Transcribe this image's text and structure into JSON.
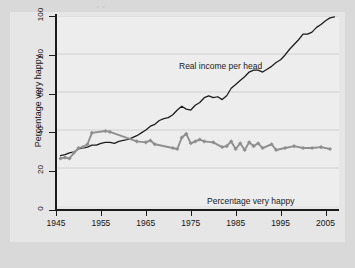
{
  "figure": {
    "background_color": "#d9d9d9",
    "panel_color": "#e6e6e6",
    "plot_color": "#ededed"
  },
  "bleed_text": {
    "top": "..",
    "middle": "Are we richer"
  },
  "chart_data": {
    "type": "line",
    "title": "",
    "subtitle": "",
    "xlabel": "",
    "ylabel": "Percentage very happy",
    "xlim": [
      1945,
      2008
    ],
    "ylim": [
      0,
      100
    ],
    "grid": true,
    "grid_axis": "y",
    "legend": "inline-annotations",
    "xticks": [
      1945,
      1955,
      1965,
      1975,
      1985,
      1995,
      2005
    ],
    "yticks": [
      0,
      20,
      40,
      60,
      80,
      100
    ],
    "colors": {
      "real_income": "#1b1b1b",
      "very_happy": "#8f8f8f",
      "gridline": "#c9c9c9",
      "axis": "#1b1b1b"
    },
    "series": [
      {
        "name": "Real income per head",
        "color": "#1b1b1b",
        "marker": "none",
        "label_text": "Real income per head",
        "x": [
          1946,
          1947,
          1948,
          1949,
          1950,
          1951,
          1952,
          1953,
          1954,
          1955,
          1956,
          1957,
          1958,
          1959,
          1960,
          1961,
          1962,
          1963,
          1964,
          1965,
          1966,
          1967,
          1968,
          1969,
          1970,
          1971,
          1972,
          1973,
          1974,
          1975,
          1976,
          1977,
          1978,
          1979,
          1980,
          1981,
          1982,
          1983,
          1984,
          1985,
          1986,
          1987,
          1988,
          1989,
          1990,
          1991,
          1992,
          1993,
          1994,
          1995,
          1996,
          1997,
          1998,
          1999,
          2000,
          2001,
          2002,
          2003,
          2004,
          2005,
          2006,
          2007
        ],
        "y": [
          26.5,
          27.0,
          28.0,
          28.5,
          30.0,
          30.5,
          31.0,
          32.0,
          32.0,
          33.0,
          33.5,
          33.5,
          33.0,
          34.0,
          34.5,
          35.0,
          36.0,
          37.0,
          38.5,
          40.0,
          42.0,
          43.0,
          45.0,
          46.0,
          46.5,
          48.0,
          50.5,
          52.5,
          51.0,
          50.5,
          53.0,
          54.5,
          57.0,
          58.0,
          57.0,
          57.5,
          56.0,
          58.0,
          62.0,
          64.0,
          66.0,
          68.0,
          70.5,
          71.5,
          71.5,
          70.5,
          72.0,
          73.5,
          75.5,
          77.0,
          79.5,
          82.5,
          85.0,
          87.5,
          90.5,
          90.5,
          91.5,
          94.0,
          95.5,
          97.5,
          99.0,
          99.5
        ]
      },
      {
        "name": "Percentage very happy",
        "color": "#8f8f8f",
        "marker": "diamond",
        "label_text": "Percentage very happy",
        "x": [
          1946,
          1947,
          1948,
          1949,
          1950,
          1951,
          1952,
          1953,
          1956,
          1957,
          1963,
          1965,
          1966,
          1967,
          1971,
          1972,
          1973,
          1974,
          1975,
          1976,
          1977,
          1978,
          1980,
          1982,
          1983,
          1984,
          1985,
          1986,
          1987,
          1988,
          1989,
          1990,
          1991,
          1993,
          1994,
          1996,
          1998,
          2000,
          2002,
          2004,
          2006
        ],
        "y": [
          25.0,
          25.5,
          25.0,
          28.0,
          30.5,
          31.0,
          32.5,
          38.5,
          39.5,
          39.0,
          34.0,
          33.5,
          34.5,
          32.5,
          30.5,
          30.0,
          36.0,
          38.0,
          33.0,
          34.0,
          35.0,
          34.0,
          33.5,
          31.0,
          31.5,
          34.0,
          30.0,
          33.0,
          29.5,
          33.5,
          31.5,
          33.0,
          30.5,
          32.5,
          29.5,
          30.5,
          31.5,
          30.5,
          30.5,
          31.0,
          30.0
        ]
      }
    ]
  }
}
